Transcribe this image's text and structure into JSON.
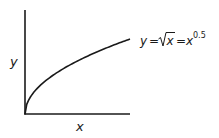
{
  "diagram": {
    "axis_labels": {
      "x": "x",
      "y": "y"
    },
    "equation": {
      "lhs": "y",
      "eq1": "=",
      "radicand": "x",
      "eq2": "=",
      "base": "x",
      "exponent": "0.5"
    },
    "curve": {
      "function": "sqrt",
      "x_range": [
        0,
        1
      ]
    },
    "colors": {
      "stroke": "#1a1a1a",
      "background": "#ffffff"
    }
  },
  "chart_data": {
    "type": "line",
    "title": "",
    "xlabel": "x",
    "ylabel": "y",
    "series": [
      {
        "name": "y = sqrt(x) = x^0.5",
        "x": [
          0,
          0.1,
          0.25,
          0.5,
          0.75,
          1.0
        ],
        "values": [
          0,
          0.316,
          0.5,
          0.707,
          0.866,
          1.0
        ]
      }
    ],
    "grid": false,
    "legend": "inline annotation at curve end"
  }
}
